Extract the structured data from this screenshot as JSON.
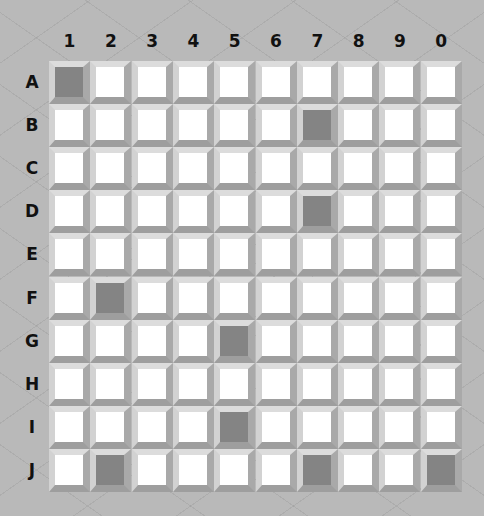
{
  "board": {
    "columns": [
      "1",
      "2",
      "3",
      "4",
      "5",
      "6",
      "7",
      "8",
      "9",
      "0"
    ],
    "rows": [
      "A",
      "B",
      "C",
      "D",
      "E",
      "F",
      "G",
      "H",
      "I",
      "J"
    ],
    "filled_cells": [
      "A1",
      "B7",
      "D7",
      "F2",
      "G5",
      "I5",
      "J2",
      "J7",
      "J0"
    ],
    "colors": {
      "empty": "#ffffff",
      "filled": "#848484",
      "background": "#b9b9b9"
    }
  }
}
